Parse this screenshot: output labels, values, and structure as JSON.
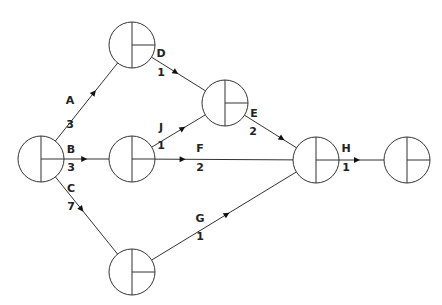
{
  "diagram": {
    "type": "activity-on-arrow network",
    "nodes": [
      {
        "id": "n1"
      },
      {
        "id": "n2"
      },
      {
        "id": "n3"
      },
      {
        "id": "n4"
      },
      {
        "id": "n5"
      },
      {
        "id": "n6"
      },
      {
        "id": "n7"
      }
    ],
    "activities": [
      {
        "name": "A",
        "duration": "3",
        "from": "n1",
        "to": "n2"
      },
      {
        "name": "B",
        "duration": "3",
        "from": "n1",
        "to": "n3"
      },
      {
        "name": "C",
        "duration": "7",
        "from": "n1",
        "to": "n7"
      },
      {
        "name": "D",
        "duration": "1",
        "from": "n2",
        "to": "n4"
      },
      {
        "name": "J",
        "duration": "1",
        "from": "n3",
        "to": "n4"
      },
      {
        "name": "F",
        "duration": "2",
        "from": "n3",
        "to": "n5"
      },
      {
        "name": "E",
        "duration": "2",
        "from": "n4",
        "to": "n5"
      },
      {
        "name": "G",
        "duration": "1",
        "from": "n7",
        "to": "n5"
      },
      {
        "name": "H",
        "duration": "1",
        "from": "n5",
        "to": "n6"
      }
    ]
  }
}
